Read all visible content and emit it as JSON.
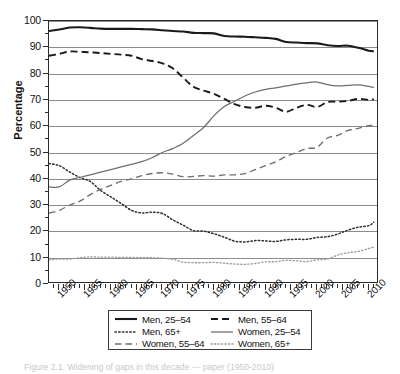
{
  "figure": {
    "caption": "Figure 2.1.  Widening of gaps in this decade — paper (1950-2010)"
  },
  "axes": {
    "ylabel": "Percentage",
    "yticks": [
      "0",
      "10",
      "20",
      "30",
      "40",
      "50",
      "60",
      "70",
      "80",
      "90",
      "100"
    ],
    "xticks": [
      "1950",
      "1955",
      "1960",
      "1965",
      "1970",
      "1975",
      "1980",
      "1985",
      "1990",
      "1995",
      "2000",
      "2005",
      "2010"
    ]
  },
  "legend": {
    "rows": [
      [
        {
          "label": "Men, 25–54",
          "style": "solid-black-thick"
        },
        {
          "label": "Men, 55–64",
          "style": "dashed-black"
        }
      ],
      [
        {
          "label": "Men, 65+",
          "style": "dotted-black"
        },
        {
          "label": "Women, 25–54",
          "style": "solid-gray"
        }
      ],
      [
        {
          "label": "Women, 55–64",
          "style": "dashed-gray"
        },
        {
          "label": "Women, 65+",
          "style": "dotted-gray"
        }
      ]
    ]
  },
  "chart_data": {
    "type": "line",
    "title": "",
    "xlabel": "",
    "ylabel": "Percentage",
    "xlim": [
      1948,
      2012
    ],
    "ylim": [
      0,
      100
    ],
    "grid": true,
    "legend_position": "below-axes",
    "x": [
      1948,
      1950,
      1952,
      1954,
      1956,
      1958,
      1960,
      1962,
      1964,
      1966,
      1968,
      1970,
      1972,
      1974,
      1976,
      1978,
      1980,
      1982,
      1984,
      1986,
      1988,
      1990,
      1992,
      1994,
      1996,
      1998,
      2000,
      2002,
      2004,
      2006,
      2008,
      2010,
      2011
    ],
    "series": [
      {
        "name": "Men, 25–54",
        "style": "solid-black-thick",
        "color": "#1a1a1a",
        "values": [
          96.2,
          96.8,
          97.5,
          97.6,
          97.4,
          97.1,
          97.0,
          97.0,
          97.0,
          96.9,
          96.8,
          96.5,
          96.2,
          96.0,
          95.5,
          95.4,
          95.3,
          94.3,
          94.1,
          94.0,
          93.8,
          93.6,
          93.2,
          92.0,
          91.8,
          91.6,
          91.5,
          90.8,
          90.5,
          90.6,
          89.8,
          88.7,
          88.5
        ]
      },
      {
        "name": "Men, 55–64",
        "style": "dashed-black",
        "color": "#1a1a1a",
        "values": [
          86.8,
          87.5,
          88.4,
          88.3,
          88.1,
          87.8,
          87.5,
          87.2,
          86.8,
          85.5,
          84.8,
          83.9,
          82.0,
          78.5,
          75.0,
          73.5,
          72.3,
          70.4,
          68.4,
          67.3,
          67.0,
          67.8,
          67.0,
          65.5,
          67.0,
          68.1,
          67.3,
          69.2,
          69.3,
          69.6,
          70.4,
          70.0,
          70.3
        ]
      },
      {
        "name": "Men, 65+",
        "style": "dotted-black",
        "color": "#2d2d2d",
        "values": [
          45.8,
          45.0,
          42.6,
          40.5,
          39.0,
          35.6,
          33.1,
          30.6,
          28.0,
          27.0,
          27.3,
          26.8,
          24.4,
          22.4,
          20.3,
          20.1,
          19.1,
          17.8,
          16.3,
          16.0,
          16.5,
          16.4,
          16.2,
          16.8,
          17.0,
          17.0,
          17.7,
          18.0,
          19.0,
          20.5,
          21.6,
          22.2,
          23.5
        ]
      },
      {
        "name": "Women, 25–54",
        "style": "solid-gray",
        "color": "#6e6e6e",
        "values": [
          36.9,
          36.9,
          39.5,
          40.5,
          41.5,
          42.5,
          43.5,
          44.5,
          45.5,
          46.5,
          48.0,
          50.0,
          51.5,
          53.5,
          56.5,
          59.5,
          64.0,
          67.5,
          69.5,
          71.5,
          73.0,
          74.0,
          74.6,
          75.3,
          76.0,
          76.5,
          76.8,
          75.8,
          75.3,
          75.5,
          75.7,
          75.1,
          74.7
        ]
      },
      {
        "name": "Women, 55–64",
        "style": "dashed-gray",
        "color": "#6e6e6e",
        "values": [
          27.0,
          28.0,
          30.0,
          31.5,
          34.0,
          36.0,
          37.5,
          39.0,
          40.0,
          41.2,
          42.0,
          42.3,
          41.8,
          40.8,
          40.9,
          41.2,
          41.0,
          41.5,
          41.5,
          42.0,
          43.5,
          45.0,
          46.5,
          48.5,
          50.0,
          51.5,
          52.0,
          55.5,
          56.5,
          58.4,
          59.2,
          60.2,
          60.2
        ]
      },
      {
        "name": "Women, 65+",
        "style": "dotted-gray",
        "color": "#9a9a9a",
        "values": [
          9.2,
          9.5,
          9.5,
          10.0,
          10.3,
          10.2,
          10.2,
          10.1,
          10.1,
          10.0,
          10.0,
          9.8,
          9.4,
          8.3,
          8.1,
          8.1,
          8.2,
          7.9,
          7.6,
          7.5,
          7.8,
          8.4,
          8.5,
          9.0,
          8.8,
          8.5,
          9.2,
          9.5,
          11.0,
          11.9,
          12.4,
          13.5,
          14.0
        ]
      }
    ]
  }
}
